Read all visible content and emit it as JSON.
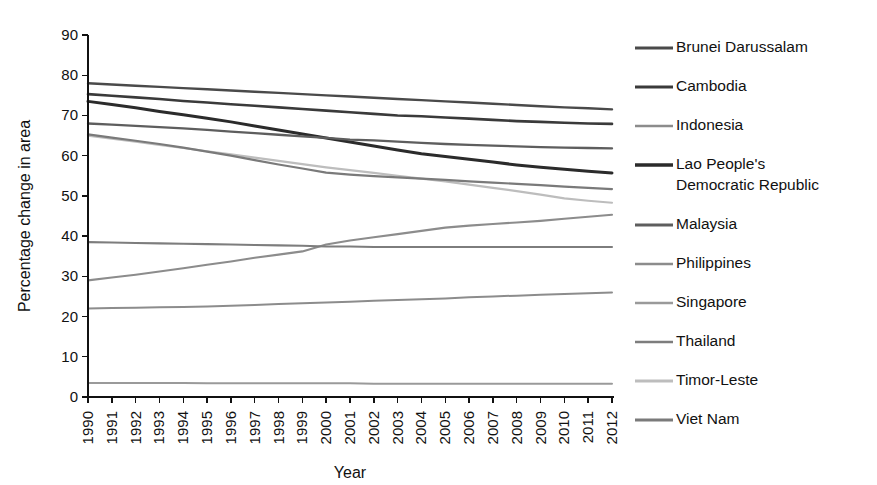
{
  "chart_data": {
    "type": "line",
    "title": "",
    "xlabel": "Year",
    "ylabel": "Percentage change in area",
    "xlim": [
      1990,
      2012
    ],
    "ylim": [
      0,
      90
    ],
    "ytick_step": 10,
    "grid": false,
    "legend_position": "right",
    "x": [
      1990,
      1991,
      1992,
      1993,
      1994,
      1995,
      1996,
      1997,
      1998,
      1999,
      2000,
      2001,
      2002,
      2003,
      2004,
      2005,
      2006,
      2007,
      2008,
      2009,
      2010,
      2011,
      2012
    ],
    "xticklabels": [
      "1990",
      "1991",
      "1992",
      "1993",
      "1994",
      "1995",
      "1996",
      "1997",
      "1998",
      "1999",
      "2000",
      "2001",
      "2002",
      "2003",
      "2004",
      "2005",
      "2006",
      "2007",
      "2008",
      "2009",
      "2010",
      "2011",
      "2012"
    ],
    "yticklabels": [
      "0",
      "10",
      "20",
      "30",
      "40",
      "50",
      "60",
      "70",
      "80",
      "90"
    ],
    "series": [
      {
        "name": "Brunei Darussalam",
        "color": "#4a4a4a",
        "width": 2.4,
        "values": [
          78.0,
          77.7,
          77.4,
          77.1,
          76.8,
          76.5,
          76.2,
          75.9,
          75.6,
          75.3,
          75.0,
          74.7,
          74.4,
          74.1,
          73.8,
          73.5,
          73.2,
          72.9,
          72.6,
          72.3,
          72.0,
          71.8,
          71.5
        ]
      },
      {
        "name": "Cambodia",
        "color": "#3a3a3a",
        "width": 2.6,
        "values": [
          75.3,
          74.9,
          74.5,
          74.1,
          73.6,
          73.2,
          72.8,
          72.4,
          72.0,
          71.6,
          71.2,
          70.8,
          70.4,
          70.0,
          69.8,
          69.5,
          69.2,
          68.9,
          68.6,
          68.4,
          68.2,
          68.0,
          67.9
        ]
      },
      {
        "name": "Indonesia",
        "color": "#8c8c8c",
        "width": 2.0,
        "values": [
          22.0,
          22.1,
          22.2,
          22.3,
          22.4,
          22.5,
          22.7,
          22.9,
          23.1,
          23.3,
          23.5,
          23.7,
          23.9,
          24.1,
          24.3,
          24.5,
          24.8,
          25.0,
          25.2,
          25.4,
          25.6,
          25.8,
          26.0
        ]
      },
      {
        "name": "Lao People's Democratic Republic",
        "color": "#2b2b2b",
        "width": 3.0,
        "values": [
          73.5,
          72.7,
          71.9,
          71.0,
          70.2,
          69.3,
          68.4,
          67.4,
          66.4,
          65.4,
          64.4,
          63.4,
          62.4,
          61.4,
          60.5,
          59.8,
          59.1,
          58.4,
          57.7,
          57.1,
          56.6,
          56.1,
          55.7
        ]
      },
      {
        "name": "Malaysia",
        "color": "#5e5e5e",
        "width": 2.3,
        "values": [
          68.0,
          67.7,
          67.4,
          67.1,
          66.8,
          66.4,
          66.0,
          65.6,
          65.2,
          64.8,
          64.4,
          64.0,
          63.8,
          63.5,
          63.2,
          62.9,
          62.7,
          62.5,
          62.3,
          62.1,
          62.0,
          61.9,
          61.8
        ]
      },
      {
        "name": "Philippines",
        "color": "#8c8c8c",
        "width": 2.1,
        "values": [
          29.0,
          29.7,
          30.4,
          31.2,
          32.0,
          32.9,
          33.7,
          34.6,
          35.4,
          36.2,
          37.9,
          38.9,
          39.7,
          40.5,
          41.3,
          42.1,
          42.6,
          43.0,
          43.4,
          43.8,
          44.3,
          44.8,
          45.3
        ]
      },
      {
        "name": "Singapore",
        "color": "#9a9a9a",
        "width": 2.0,
        "values": [
          3.5,
          3.5,
          3.5,
          3.5,
          3.5,
          3.4,
          3.4,
          3.4,
          3.4,
          3.4,
          3.4,
          3.4,
          3.3,
          3.3,
          3.3,
          3.3,
          3.3,
          3.3,
          3.3,
          3.3,
          3.3,
          3.3,
          3.3
        ]
      },
      {
        "name": "Thailand",
        "color": "#7d7d7d",
        "width": 2.1,
        "values": [
          38.5,
          38.4,
          38.3,
          38.2,
          38.1,
          38.0,
          37.9,
          37.8,
          37.7,
          37.6,
          37.4,
          37.4,
          37.3,
          37.3,
          37.3,
          37.3,
          37.3,
          37.3,
          37.3,
          37.3,
          37.3,
          37.3,
          37.3
        ]
      },
      {
        "name": "Timor-Leste",
        "color": "#bdbdbd",
        "width": 2.2,
        "values": [
          65.0,
          64.2,
          63.5,
          62.7,
          61.9,
          61.1,
          60.3,
          59.5,
          58.7,
          57.9,
          57.1,
          56.4,
          55.7,
          55.0,
          54.3,
          53.6,
          52.8,
          52.0,
          51.2,
          50.3,
          49.4,
          48.8,
          48.3
        ]
      },
      {
        "name": "Viet Nam",
        "color": "#7a7a7a",
        "width": 2.2,
        "values": [
          65.3,
          64.5,
          63.7,
          62.9,
          62.0,
          61.0,
          60.0,
          58.9,
          57.8,
          56.8,
          55.8,
          55.3,
          54.9,
          54.6,
          54.3,
          54.0,
          53.6,
          53.3,
          53.0,
          52.7,
          52.3,
          52.0,
          51.7
        ]
      }
    ]
  },
  "legend": {
    "items": [
      {
        "label": "Brunei Darussalam",
        "label2": ""
      },
      {
        "label": "Cambodia",
        "label2": ""
      },
      {
        "label": "Indonesia",
        "label2": ""
      },
      {
        "label": "Lao People's",
        "label2": "Democratic Republic"
      },
      {
        "label": "Malaysia",
        "label2": ""
      },
      {
        "label": "Philippines",
        "label2": ""
      },
      {
        "label": "Singapore",
        "label2": ""
      },
      {
        "label": "Thailand",
        "label2": ""
      },
      {
        "label": "Timor-Leste",
        "label2": ""
      },
      {
        "label": "Viet Nam",
        "label2": ""
      }
    ]
  }
}
